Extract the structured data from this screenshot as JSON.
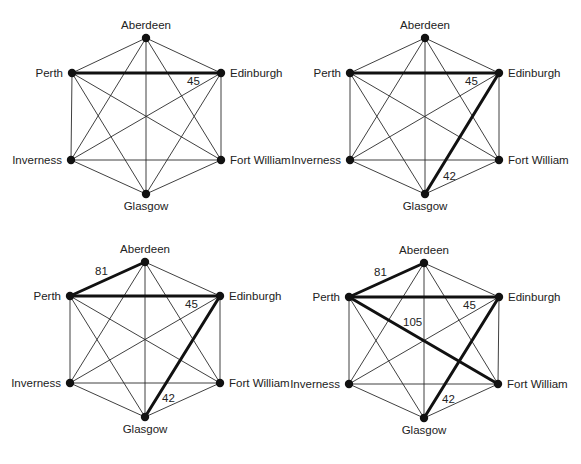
{
  "title": "",
  "colors": {
    "edge": "#2a2a2a",
    "highlight": "#111111",
    "node": "#111111",
    "text": "#222222",
    "background": "#ffffff"
  },
  "nodes": [
    "Aberdeen",
    "Perth",
    "Edinburgh",
    "Inverness",
    "Fort William",
    "Glasgow"
  ],
  "panels": [
    {
      "id": "panel-1",
      "positions": {
        "Aberdeen": [
          146,
          38
        ],
        "Perth": [
          72,
          73
        ],
        "Edinburgh": [
          221,
          73
        ],
        "Inverness": [
          71,
          160
        ],
        "Fort William": [
          221,
          160
        ],
        "Glasgow": [
          146,
          194
        ]
      },
      "highlighted_edges": [
        {
          "from": "Perth",
          "to": "Edinburgh",
          "weight": "45",
          "label_pos": [
            187,
            85
          ]
        }
      ]
    },
    {
      "id": "panel-2",
      "positions": {
        "Aberdeen": [
          425,
          38
        ],
        "Perth": [
          350,
          73
        ],
        "Edinburgh": [
          499,
          73
        ],
        "Inverness": [
          350,
          160
        ],
        "Fort William": [
          499,
          160
        ],
        "Glasgow": [
          425,
          194
        ]
      },
      "highlighted_edges": [
        {
          "from": "Perth",
          "to": "Edinburgh",
          "weight": "45",
          "label_pos": [
            465,
            85
          ]
        },
        {
          "from": "Edinburgh",
          "to": "Glasgow",
          "weight": "42",
          "label_pos": [
            443,
            180
          ]
        }
      ]
    },
    {
      "id": "panel-3",
      "positions": {
        "Aberdeen": [
          145,
          262
        ],
        "Perth": [
          70,
          296
        ],
        "Edinburgh": [
          220,
          296
        ],
        "Inverness": [
          70,
          383
        ],
        "Fort William": [
          220,
          383
        ],
        "Glasgow": [
          145,
          417
        ]
      },
      "highlighted_edges": [
        {
          "from": "Perth",
          "to": "Aberdeen",
          "weight": "81",
          "label_pos": [
            95,
            275
          ]
        },
        {
          "from": "Perth",
          "to": "Edinburgh",
          "weight": "45",
          "label_pos": [
            185,
            308
          ]
        },
        {
          "from": "Edinburgh",
          "to": "Glasgow",
          "weight": "42",
          "label_pos": [
            162,
            402
          ]
        }
      ]
    },
    {
      "id": "panel-4",
      "positions": {
        "Aberdeen": [
          424,
          263
        ],
        "Perth": [
          349,
          297
        ],
        "Edinburgh": [
          499,
          297
        ],
        "Inverness": [
          349,
          384
        ],
        "Fort William": [
          498,
          384
        ],
        "Glasgow": [
          424,
          418
        ]
      },
      "highlighted_edges": [
        {
          "from": "Perth",
          "to": "Aberdeen",
          "weight": "81",
          "label_pos": [
            374,
            276
          ]
        },
        {
          "from": "Perth",
          "to": "Edinburgh",
          "weight": "45",
          "label_pos": [
            463,
            309
          ]
        },
        {
          "from": "Perth",
          "to": "Fort William",
          "weight": "105",
          "label_pos": [
            403,
            326
          ]
        },
        {
          "from": "Edinburgh",
          "to": "Glasgow",
          "weight": "42",
          "label_pos": [
            442,
            403
          ]
        }
      ]
    }
  ],
  "label_placement": {
    "Aberdeen": "above",
    "Perth": "left",
    "Edinburgh": "right",
    "Inverness": "left",
    "Fort William": "right",
    "Glasgow": "below"
  }
}
